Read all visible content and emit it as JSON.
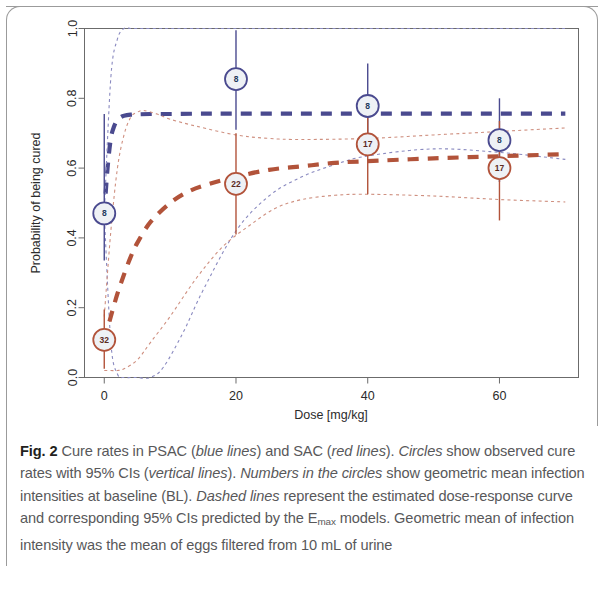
{
  "figure": {
    "label": "Fig. 2",
    "caption_parts": [
      {
        "text": "Cure rates in PSAC (",
        "style": "normal"
      },
      {
        "text": "blue lines",
        "style": "italic"
      },
      {
        "text": ") and SAC (",
        "style": "normal"
      },
      {
        "text": "red lines",
        "style": "italic"
      },
      {
        "text": "). ",
        "style": "normal"
      },
      {
        "text": "Circles",
        "style": "italic"
      },
      {
        "text": " show observed cure rates with 95% CIs (",
        "style": "normal"
      },
      {
        "text": "vertical lines",
        "style": "italic"
      },
      {
        "text": "). ",
        "style": "normal"
      },
      {
        "text": "Numbers in the circles",
        "style": "italic"
      },
      {
        "text": " show geometric mean infection intensities at baseline (BL). ",
        "style": "normal"
      },
      {
        "text": "Dashed lines",
        "style": "italic"
      },
      {
        "text": " represent the estimated dose-response curve and corresponding 95% CIs predicted by the E",
        "style": "normal"
      },
      {
        "text": "max",
        "style": "sub"
      },
      {
        "text": " models. Geometric mean of infection intensity was the mean of eggs filtered from 10 mL of urine",
        "style": "normal"
      }
    ],
    "caption_plain": "Fig. 2 Cure rates in PSAC (blue lines) and SAC (red lines). Circles show observed cure rates with 95% CIs (vertical lines). Numbers in the circles show geometric mean infection intensities at baseline (BL). Dashed lines represent the estimated dose-response curve and corresponding 95% CIs predicted by the Emax models. Geometric mean of infection intensity was the mean of eggs filtered from 10 mL of urine"
  },
  "chart_data": {
    "type": "line",
    "title": "",
    "xlabel": "Dose [mg/kg]",
    "ylabel": "Probability of being cured",
    "xlim": [
      -3,
      72
    ],
    "ylim": [
      0.0,
      1.0
    ],
    "xticks": [
      0,
      20,
      40,
      60
    ],
    "xtick_labels": [
      "0",
      "20",
      "40",
      "60"
    ],
    "yticks": [
      0.0,
      0.2,
      0.4,
      0.6,
      0.8,
      1.0
    ],
    "ytick_labels": [
      "0.0",
      "0.2",
      "0.4",
      "0.6",
      "0.8",
      "1.0"
    ],
    "grid": false,
    "legend": "none",
    "colors": {
      "psac_blue": "#4a4a8f",
      "sac_red": "#b2533a",
      "psac_ci_dotted": "#8a8ac0",
      "sac_ci_dotted": "#cf9080",
      "axis": "#6b6b6b",
      "bubble_fill": "#eef1f5"
    },
    "series": [
      {
        "name": "PSAC estimated dose-response curve (Emax)",
        "group": "PSAC",
        "color": "#4a4a8f",
        "style": "dashed",
        "x": [
          0,
          0.5,
          1,
          1.5,
          2,
          2.5,
          3,
          4,
          5,
          7,
          10,
          15,
          20,
          30,
          40,
          50,
          60,
          70
        ],
        "y": [
          0.47,
          0.6,
          0.685,
          0.72,
          0.738,
          0.746,
          0.75,
          0.753,
          0.754,
          0.755,
          0.755,
          0.756,
          0.756,
          0.756,
          0.756,
          0.756,
          0.756,
          0.756
        ]
      },
      {
        "name": "PSAC 95% CI upper",
        "group": "PSAC",
        "color": "#8a8ac0",
        "style": "dotted",
        "x": [
          0,
          1,
          2,
          3,
          4,
          5,
          6,
          8,
          10,
          15,
          20,
          25,
          30,
          40,
          50,
          60,
          70
        ],
        "y": [
          0.47,
          0.86,
          0.97,
          1.0,
          1.0,
          1.0,
          1.0,
          1.0,
          1.0,
          1.0,
          1.0,
          1.0,
          1.0,
          1.0,
          1.0,
          1.0,
          1.0
        ]
      },
      {
        "name": "PSAC 95% CI lower",
        "group": "PSAC",
        "color": "#8a8ac0",
        "style": "dotted",
        "x": [
          0,
          1,
          2,
          3,
          4,
          5,
          7,
          9,
          12,
          15,
          20,
          25,
          30,
          35,
          40,
          50,
          60,
          70
        ],
        "y": [
          0.47,
          0.1,
          0.01,
          0.0,
          0.0,
          0.0,
          0.0,
          0.03,
          0.13,
          0.25,
          0.42,
          0.52,
          0.575,
          0.61,
          0.635,
          0.655,
          0.645,
          0.625
        ]
      },
      {
        "name": "SAC estimated dose-response curve (Emax)",
        "group": "SAC",
        "color": "#b2533a",
        "style": "dashed",
        "x": [
          0,
          1,
          2,
          3,
          4,
          5,
          7,
          10,
          13,
          16,
          20,
          25,
          30,
          35,
          40,
          50,
          60,
          70
        ],
        "y": [
          0.105,
          0.175,
          0.24,
          0.295,
          0.345,
          0.385,
          0.445,
          0.5,
          0.535,
          0.555,
          0.575,
          0.595,
          0.605,
          0.615,
          0.62,
          0.628,
          0.634,
          0.64
        ]
      },
      {
        "name": "SAC 95% CI upper",
        "group": "SAC",
        "color": "#cf9080",
        "style": "dotted",
        "x": [
          0,
          1,
          2,
          3,
          4,
          5,
          6,
          8,
          10,
          14,
          20,
          25,
          30,
          40,
          50,
          60,
          70
        ],
        "y": [
          0.175,
          0.42,
          0.6,
          0.695,
          0.745,
          0.76,
          0.765,
          0.755,
          0.74,
          0.72,
          0.695,
          0.685,
          0.682,
          0.685,
          0.695,
          0.705,
          0.715
        ]
      },
      {
        "name": "SAC 95% CI lower",
        "group": "SAC",
        "color": "#cf9080",
        "style": "dotted",
        "x": [
          0,
          1,
          2,
          3,
          5,
          7,
          10,
          14,
          18,
          22,
          26,
          30,
          35,
          40,
          50,
          60,
          70
        ],
        "y": [
          0.02,
          0.02,
          0.02,
          0.025,
          0.05,
          0.1,
          0.175,
          0.285,
          0.375,
          0.435,
          0.485,
          0.51,
          0.522,
          0.525,
          0.52,
          0.51,
          0.503
        ]
      }
    ],
    "points": [
      {
        "group": "PSAC",
        "dose": 0,
        "cure_rate": 0.47,
        "ci_low": 0.335,
        "ci_high": 0.755,
        "bl_intensity": "8",
        "color": "#4a4a8f"
      },
      {
        "group": "PSAC",
        "dose": 20,
        "cure_rate": 0.855,
        "ci_low": 0.71,
        "ci_high": 0.995,
        "bl_intensity": "8",
        "color": "#4a4a8f"
      },
      {
        "group": "PSAC",
        "dose": 40,
        "cure_rate": 0.778,
        "ci_low": 0.64,
        "ci_high": 0.9,
        "bl_intensity": "8",
        "color": "#4a4a8f"
      },
      {
        "group": "PSAC",
        "dose": 60,
        "cure_rate": 0.68,
        "ci_low": 0.56,
        "ci_high": 0.8,
        "bl_intensity": "8",
        "color": "#4a4a8f"
      },
      {
        "group": "SAC",
        "dose": 0,
        "cure_rate": 0.108,
        "ci_low": 0.025,
        "ci_high": 0.195,
        "bl_intensity": "32",
        "color": "#b2533a"
      },
      {
        "group": "SAC",
        "dose": 20,
        "cure_rate": 0.555,
        "ci_low": 0.41,
        "ci_high": 0.7,
        "bl_intensity": "22",
        "color": "#b2533a"
      },
      {
        "group": "SAC",
        "dose": 40,
        "cure_rate": 0.668,
        "ci_low": 0.525,
        "ci_high": 0.8,
        "bl_intensity": "17",
        "color": "#b2533a"
      },
      {
        "group": "SAC",
        "dose": 60,
        "cure_rate": 0.6,
        "ci_low": 0.45,
        "ci_high": 0.735,
        "bl_intensity": "17",
        "color": "#b2533a"
      }
    ]
  }
}
